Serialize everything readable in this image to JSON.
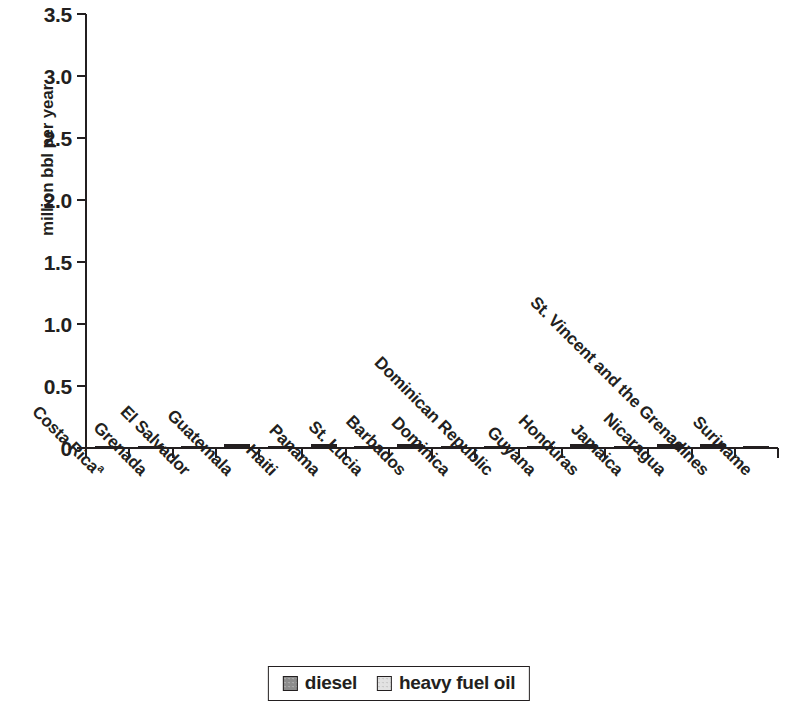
{
  "chart_data": {
    "type": "bar",
    "stacked": true,
    "title": "",
    "xlabel": "",
    "ylabel": "million bbl per year",
    "ylim": [
      0,
      3.5
    ],
    "yticks": [
      "0",
      "0.5",
      "1.0",
      "1.5",
      "2.0",
      "2.5",
      "3.0",
      "3.5"
    ],
    "ytick_values": [
      0,
      0.5,
      1.0,
      1.5,
      2.0,
      2.5,
      3.0,
      3.5
    ],
    "grid": false,
    "legend_position": "bottom",
    "categories": [
      "Costa Rica",
      "Grenada",
      "El Salvador",
      "Guatemala",
      "Haiti",
      "Panama",
      "St. Lucia",
      "Barbados",
      "Dominica",
      "Dominican Republic",
      "Guyana",
      "Honduras",
      "Jamaica",
      "Nicaragua",
      "St. Vincent and the Grenadines",
      "Suriname"
    ],
    "category_superscripts": [
      "a",
      "",
      "",
      "",
      "",
      "",
      "",
      "",
      "",
      "",
      "",
      "",
      "",
      "",
      "",
      ""
    ],
    "series": [
      {
        "name": "diesel",
        "color": "#8c8c8c",
        "values": [
          0.3,
          0.02,
          0.8,
          0.76,
          0.09,
          0.55,
          0.06,
          0.02,
          0.01,
          3.15,
          0.17,
          0.28,
          1.82,
          0.23,
          0.01,
          0.66
        ]
      },
      {
        "name": "heavy fuel oil",
        "color": "#dcdcdc",
        "values": [
          0.0,
          0.0,
          0.0,
          0.42,
          0.0,
          0.44,
          0.0,
          0.13,
          0.0,
          0.0,
          0.0,
          0.92,
          0.0,
          0.51,
          0.03,
          0.0
        ]
      }
    ],
    "totals": [
      0.3,
      0.02,
      0.8,
      1.18,
      0.09,
      0.99,
      0.06,
      0.15,
      0.01,
      3.15,
      0.17,
      1.2,
      1.82,
      0.74,
      0.04,
      0.66
    ]
  },
  "legend": {
    "items": [
      {
        "label": "diesel",
        "swatch": "diesel-swatch"
      },
      {
        "label": "heavy fuel oil",
        "swatch": "heavy-fuel-oil-swatch"
      }
    ]
  }
}
